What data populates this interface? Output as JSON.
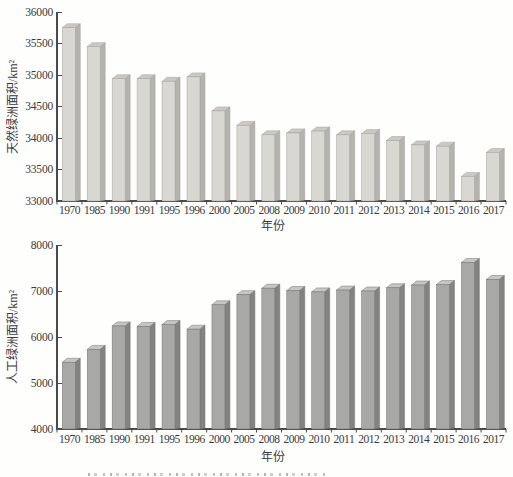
{
  "chart_data": [
    {
      "type": "bar",
      "title": "",
      "ylabel": "天然绿洲面积/km²",
      "xlabel": "年份",
      "categories": [
        "1970",
        "1985",
        "1990",
        "1991",
        "1995",
        "1996",
        "2000",
        "2005",
        "2008",
        "2009",
        "2010",
        "2011",
        "2012",
        "2013",
        "2014",
        "2015",
        "2016",
        "2017"
      ],
      "values": [
        35750,
        35450,
        34940,
        34940,
        34900,
        34970,
        34430,
        34200,
        34050,
        34080,
        34110,
        34050,
        34070,
        33960,
        33890,
        33870,
        33390,
        33770
      ],
      "ylim": [
        33000,
        36000
      ],
      "yticks": [
        36000,
        35500,
        35000,
        34500,
        34000,
        33500,
        33000
      ],
      "grid": false,
      "legend": null,
      "bar_style": "pseudo-3d-column",
      "bar_colors": {
        "front": "#d9d7d2",
        "side": "#b5b3ae",
        "top": "#cbc9c4",
        "edge": "#a3a19c"
      }
    },
    {
      "type": "bar",
      "title": "",
      "ylabel": "人工绿洲面积/km²",
      "xlabel": "年份",
      "categories": [
        "1970",
        "1985",
        "1990",
        "1991",
        "1995",
        "1996",
        "2000",
        "2005",
        "2008",
        "2009",
        "2010",
        "2011",
        "2012",
        "2013",
        "2014",
        "2015",
        "2016",
        "2017"
      ],
      "values": [
        5450,
        5730,
        6240,
        6230,
        6270,
        6170,
        6700,
        6920,
        7060,
        7010,
        6980,
        7020,
        7000,
        7070,
        7130,
        7140,
        7620,
        7250
      ],
      "ylim": [
        4000,
        8000
      ],
      "yticks": [
        8000,
        7000,
        6000,
        5000,
        4000
      ],
      "grid": false,
      "legend": null,
      "bar_style": "pseudo-3d-column",
      "bar_colors": {
        "front": "#a8a8a6",
        "side": "#838381",
        "top": "#c6c6c3",
        "edge": "#737370"
      }
    }
  ],
  "axis_color": "#4a4a4a",
  "text_color": "#3a3a3a"
}
